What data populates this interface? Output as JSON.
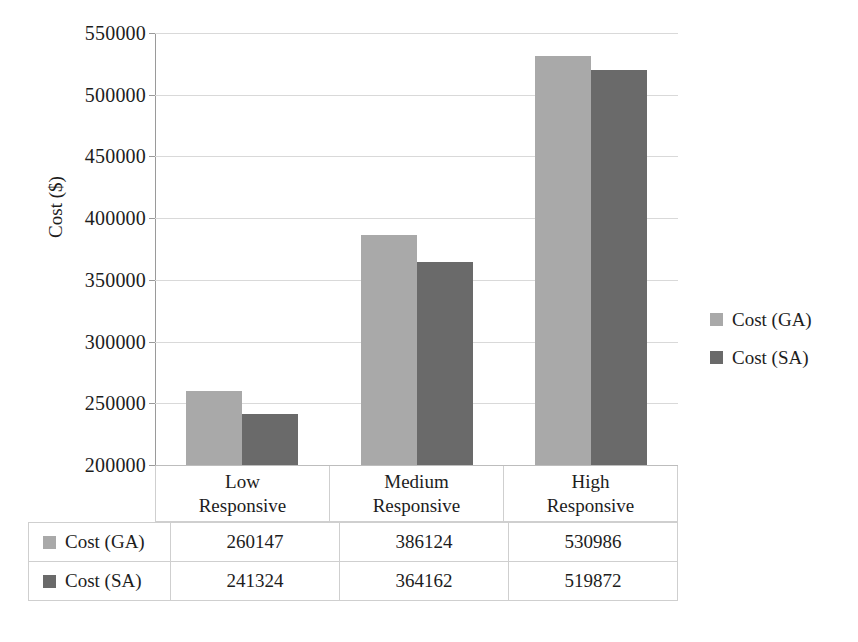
{
  "chart_data": {
    "type": "bar",
    "title": "",
    "xlabel": "",
    "ylabel": "Cost ($)",
    "ylim": [
      200000,
      550000
    ],
    "ytick_step": 50000,
    "yticks": [
      "550000",
      "500000",
      "450000",
      "400000",
      "350000",
      "300000",
      "250000",
      "200000"
    ],
    "categories": [
      "Low Responsive",
      "Medium Responsive",
      "High Responsive"
    ],
    "category_lines": [
      [
        "Low",
        "Responsive"
      ],
      [
        "Medium",
        "Responsive"
      ],
      [
        "High",
        "Responsive"
      ]
    ],
    "grid": true,
    "legend_position": "right",
    "series": [
      {
        "name": "Cost (GA)",
        "color": "#a9a9a9",
        "values": [
          260147,
          386124,
          530986
        ],
        "labels": [
          "260147",
          "386124",
          "530986"
        ]
      },
      {
        "name": "Cost (SA)",
        "color": "#6a6a6a",
        "values": [
          241324,
          364162,
          519872
        ],
        "labels": [
          "241324",
          "364162",
          "519872"
        ]
      }
    ]
  },
  "legend": {
    "items": [
      {
        "label": "Cost (GA)",
        "color": "#a9a9a9"
      },
      {
        "label": "Cost (SA)",
        "color": "#6a6a6a"
      }
    ]
  },
  "table": {
    "rows": [
      {
        "series": "Cost (GA)",
        "color": "#a9a9a9",
        "values": [
          "260147",
          "386124",
          "530986"
        ]
      },
      {
        "series": "Cost (SA)",
        "color": "#6a6a6a",
        "values": [
          "241324",
          "364162",
          "519872"
        ]
      }
    ]
  }
}
